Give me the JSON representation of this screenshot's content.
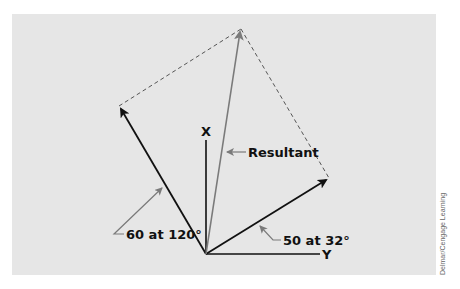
{
  "diagram": {
    "background_color": "#e6e6e6",
    "axes": {
      "x_label": "X",
      "y_label": "Y",
      "origin": [
        206,
        254
      ]
    },
    "vectors": [
      {
        "name": "vector-60-at-120",
        "label": "60 at 120°",
        "magnitude": 60,
        "angle_deg": 120,
        "tip": [
          119,
          106
        ],
        "color": "#111111"
      },
      {
        "name": "vector-50-at-32",
        "label": "50 at 32°",
        "magnitude": 50,
        "angle_deg": 32,
        "tip": [
          329,
          178
        ],
        "color": "#111111"
      },
      {
        "name": "resultant",
        "label": "Resultant",
        "tip": [
          241,
          29
        ],
        "color": "#7a7a7a"
      }
    ],
    "labels": {
      "v1": "60 at 120°",
      "v2": "50 at 32°",
      "resultant": "Resultant",
      "x_axis": "X",
      "y_axis": "Y"
    },
    "credit": "Delmar/Cengage Learning"
  }
}
